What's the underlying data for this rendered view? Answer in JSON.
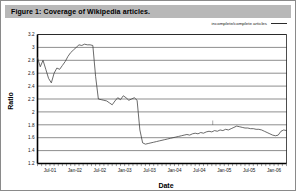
{
  "figure": {
    "title": "Figure 1: Coverage of Wikipedia articles.",
    "border_color": "#8a8a8a",
    "title_banner_color": "#b8b8b8"
  },
  "legend": {
    "label": "incomplete/complete articles",
    "line_color": "#2b2b2b",
    "position": "top-right"
  },
  "chart_data": {
    "type": "line",
    "title": "Figure 1: Coverage of Wikipedia articles.",
    "xlabel": "Date",
    "ylabel": "Ratio",
    "grid": true,
    "legend_position": "top-right",
    "ylim": [
      1.2,
      3.2
    ],
    "yticks": [
      "1.2",
      "1.4",
      "1.6",
      "1.8",
      "2",
      "2.2",
      "2.4",
      "2.6",
      "2.8",
      "3",
      "3.2"
    ],
    "xticks": [
      "Jul-01",
      "Jan-02",
      "Jul-02",
      "Jan-03",
      "Jul-03",
      "Jan-04",
      "Jul-04",
      "Jan-05",
      "Jul-05",
      "Jan-06"
    ],
    "xlim_labels": [
      "Jul-01",
      "Jan-06"
    ],
    "series": [
      {
        "name": "incomplete/complete articles",
        "color": "#3a3a3a",
        "x": [
          0.0,
          0.6,
          1.2,
          1.8,
          2.4,
          3.0,
          3.6,
          4.2,
          4.8,
          5.4,
          6.0,
          6.6,
          7.2,
          7.8,
          8.4,
          9.0,
          9.6,
          10.2,
          10.8,
          11.4,
          12.0,
          12.6,
          13.2,
          13.8,
          14.4,
          15.0,
          15.6,
          16.2,
          16.8,
          17.4,
          18.0,
          18.6,
          19.2,
          19.8,
          20.4,
          21.0,
          21.6,
          22.2,
          22.8,
          23.4,
          24.0,
          24.6,
          25.2,
          25.8,
          26.4,
          27.0,
          27.6,
          28.2,
          28.8,
          29.4,
          30.0,
          30.6,
          31.2,
          31.8,
          32.4,
          33.0,
          33.6,
          34.2,
          34.8,
          35.4,
          36.0,
          36.6,
          37.2,
          37.8,
          38.4,
          39.0,
          39.6,
          40.2,
          40.8,
          41.4,
          42.0,
          42.6,
          43.2,
          43.8,
          44.4,
          45.0,
          45.6,
          46.2,
          46.8,
          47.4,
          48.0,
          48.6,
          49.2,
          49.8,
          50.4,
          51.0,
          51.6,
          52.2,
          52.8,
          53.4,
          54.0
        ],
        "y": [
          2.84,
          2.7,
          2.8,
          2.66,
          2.52,
          2.45,
          2.6,
          2.68,
          2.66,
          2.72,
          2.78,
          2.86,
          2.92,
          2.96,
          3.0,
          3.04,
          3.03,
          3.05,
          3.04,
          3.04,
          3.03,
          2.55,
          2.2,
          2.19,
          2.18,
          2.17,
          2.14,
          2.11,
          2.17,
          2.22,
          2.19,
          2.25,
          2.22,
          2.18,
          2.2,
          2.22,
          2.18,
          1.72,
          1.52,
          1.5,
          1.51,
          1.52,
          1.53,
          1.54,
          1.55,
          1.56,
          1.57,
          1.58,
          1.59,
          1.6,
          1.61,
          1.62,
          1.63,
          1.64,
          1.65,
          1.64,
          1.66,
          1.67,
          1.66,
          1.68,
          1.67,
          1.69,
          1.7,
          1.69,
          1.71,
          1.7,
          1.72,
          1.71,
          1.73,
          1.72,
          1.74,
          1.76,
          1.78,
          1.77,
          1.76,
          1.75,
          1.75,
          1.74,
          1.74,
          1.73,
          1.73,
          1.72,
          1.7,
          1.68,
          1.66,
          1.64,
          1.63,
          1.64,
          1.7,
          1.72,
          1.71
        ]
      }
    ],
    "annotations": [
      {
        "name": "tick-marker",
        "x": 38.0,
        "y": 1.82,
        "label": ""
      }
    ]
  }
}
